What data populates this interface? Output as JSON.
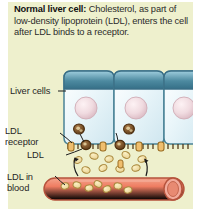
{
  "figure": {
    "name": "ldl-uptake-normal-liver-cell-diagram",
    "background_color": "#eef0cd",
    "page_color": "#ffffff"
  },
  "caption": {
    "lead": "Normal liver cell:",
    "text": " Cholesterol, as part of low-density lipoprotein (LDL), enters the cell after LDL binds to a receptor.",
    "full": "Normal liver cell: Cholesterol, as part of low-density lipoprotein (LDL), enters the cell after LDL binds to a receptor."
  },
  "labels": {
    "liver_cells": "Liver cells",
    "ldl_receptor_line1": "LDL",
    "ldl_receptor_line2": "receptor",
    "ldl": "LDL",
    "ldl_in_blood_line1": "LDL in",
    "ldl_in_blood_line2": "blood"
  },
  "colors": {
    "panel_background": "#eef0cd",
    "cell_body": "#e8f4f8",
    "cell_top": "#3d7f97",
    "cell_top_light": "#8fc3d6",
    "cell_outline": "#4a7f92",
    "nucleus": "#edd8dd",
    "nucleus_outline": "#d9b9c2",
    "ldl_particle": "#f0dfa8",
    "ldl_particle_outline": "#a8883c",
    "receptor": "#e8b968",
    "vesicle": "#6b4420",
    "blood_vessel": "#ef8a72",
    "blood_vessel_outline": "#b5533c",
    "vessel_cap": "#f0a898",
    "text": "#262626"
  },
  "art": {
    "cells": [
      {
        "name": "liver-cell-1"
      },
      {
        "name": "liver-cell-2"
      },
      {
        "name": "liver-cell-3"
      }
    ],
    "cell_count": 3,
    "blood_vessel": {
      "name": "blood-vessel",
      "orientation": "horizontal"
    },
    "arrows": [
      {
        "name": "uptake-arrow-left"
      },
      {
        "name": "uptake-arrow-right"
      }
    ]
  }
}
